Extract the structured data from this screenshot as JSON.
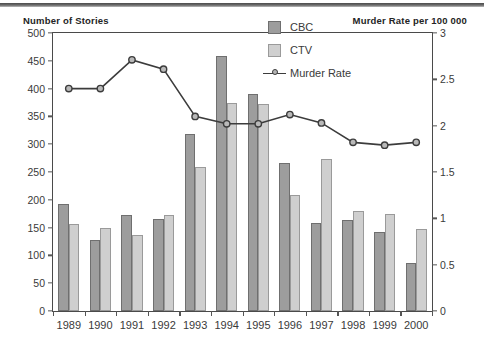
{
  "figure": {
    "left_axis_title": "Number of Stories",
    "right_axis_title": "Murder Rate per 100 000"
  },
  "legend": {
    "position": "top-right-inside",
    "items": [
      {
        "label": "CBC",
        "type": "bar",
        "color": "#9d9d9d",
        "icon": "square-swatch-icon"
      },
      {
        "label": "CTV",
        "type": "bar",
        "color": "#cfcfcf",
        "icon": "square-swatch-icon"
      },
      {
        "label": "Murder Rate",
        "type": "line",
        "color": "#3c3c3c",
        "icon": "line-marker-icon"
      }
    ]
  },
  "chart_data": {
    "type": "bar",
    "title": "",
    "subtitle": "",
    "xlabel": "",
    "ylabel": "Number of Stories",
    "y2label": "Murder Rate per 100 000",
    "grid": false,
    "legend_position": "top-right",
    "categories": [
      "1989",
      "1990",
      "1991",
      "1992",
      "1993",
      "1994",
      "1995",
      "1996",
      "1997",
      "1998",
      "1999",
      "2000"
    ],
    "ylim": [
      0,
      500
    ],
    "yticks": [
      0,
      50,
      100,
      150,
      200,
      250,
      300,
      350,
      400,
      450,
      500
    ],
    "ytick_labels": [
      "0",
      "50",
      "100",
      "150",
      "200",
      "250",
      "300",
      "350",
      "400",
      "450",
      "500"
    ],
    "y2lim": [
      0,
      3
    ],
    "y2ticks": [
      0,
      0.5,
      1,
      1.5,
      2,
      2.5,
      3
    ],
    "y2tick_labels": [
      "0",
      "0.5",
      "1",
      "1.5",
      "2",
      "2.5",
      "3"
    ],
    "series": [
      {
        "name": "CBC",
        "axis": "left",
        "kind": "bar",
        "color": "#9d9d9d",
        "values": [
          193,
          128,
          172,
          165,
          318,
          459,
          390,
          266,
          158,
          164,
          143,
          87
        ]
      },
      {
        "name": "CTV",
        "axis": "left",
        "kind": "bar",
        "color": "#cfcfcf",
        "values": [
          157,
          150,
          137,
          172,
          259,
          375,
          372,
          209,
          273,
          179,
          175,
          148
        ]
      },
      {
        "name": "Murder Rate",
        "axis": "right",
        "kind": "line",
        "color": "#3c3c3c",
        "values": [
          2.4,
          2.4,
          2.71,
          2.61,
          2.1,
          2.02,
          2.02,
          2.12,
          2.03,
          1.82,
          1.79,
          1.82
        ]
      }
    ]
  }
}
